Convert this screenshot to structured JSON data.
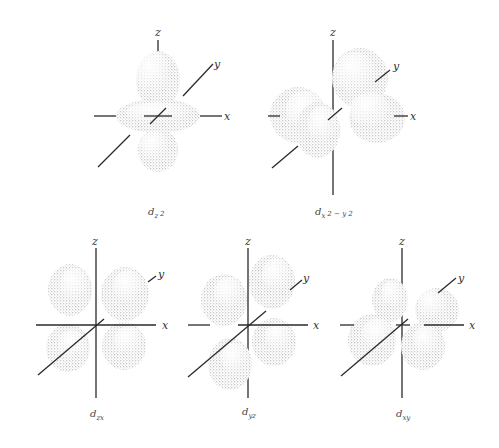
{
  "figure": {
    "axis_labels": {
      "x": "x",
      "y": "y",
      "z": "z"
    },
    "lobe_color": "#9a9a9a",
    "axis_color": "#2a2a2a"
  },
  "orbitals": [
    {
      "id": "dz2",
      "label_main": "d",
      "label_sub": "z",
      "label_sup": "2",
      "caption": "d_z2"
    },
    {
      "id": "dx2-y2",
      "label_main": "d",
      "label_sub": "x",
      "label_sup": "2 − y 2",
      "caption": "d_x2−y2"
    },
    {
      "id": "dzx",
      "label_main": "d",
      "label_sub": "zx",
      "caption": "d_zx"
    },
    {
      "id": "dyz",
      "label_main": "d",
      "label_sub": "yz",
      "caption": "d_yz"
    },
    {
      "id": "dxy",
      "label_main": "d",
      "label_sub": "xy",
      "caption": "d_xy"
    }
  ]
}
